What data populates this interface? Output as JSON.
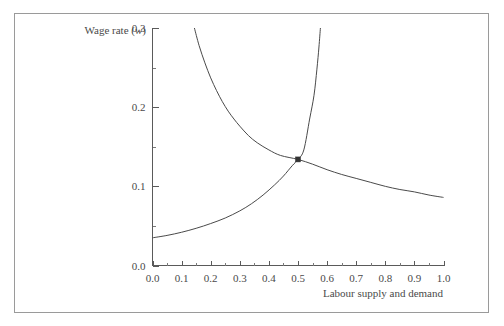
{
  "figure": {
    "border_color": "#9a9a9a",
    "background": "#ffffff"
  },
  "chart_data": {
    "type": "line",
    "title": "",
    "subtitle": "",
    "xlabel": "Labour supply and demand",
    "ylabel": "Wage rate (w)",
    "ylabel_plain": "Wage rate (",
    "ylabel_italic": "w",
    "ylabel_close": ")",
    "xlim": [
      0.0,
      1.0
    ],
    "ylim": [
      0.0,
      0.3
    ],
    "grid": false,
    "legend": "none",
    "x_ticks": [
      "0.0",
      "0.1",
      "0.2",
      "0.3",
      "0.4",
      "0.5",
      "0.6",
      "0.7",
      "0.8",
      "0.9",
      "1.0"
    ],
    "x_tick_values": [
      0.0,
      0.1,
      0.2,
      0.3,
      0.4,
      0.5,
      0.6,
      0.7,
      0.8,
      0.9,
      1.0
    ],
    "x_minor_values": [
      0.05,
      0.15,
      0.25,
      0.35,
      0.45,
      0.55,
      0.65,
      0.75,
      0.85,
      0.95
    ],
    "y_ticks": [
      "0.0",
      "0.1",
      "0.2",
      "0.3"
    ],
    "y_tick_values": [
      0.0,
      0.1,
      0.2,
      0.3
    ],
    "y_minor_values": [
      0.05,
      0.15,
      0.25
    ],
    "line_color": "#4a4a4a",
    "axis_color": "#5a5a5a",
    "marker_color": "#333333",
    "equilibrium": {
      "label": "",
      "x": 0.5,
      "y": 0.134
    },
    "series": [
      {
        "name": "Labour demand",
        "kind": "demand",
        "points": [
          [
            0.144,
            0.3
          ],
          [
            0.16,
            0.278
          ],
          [
            0.18,
            0.256
          ],
          [
            0.2,
            0.237
          ],
          [
            0.22,
            0.221
          ],
          [
            0.24,
            0.207
          ],
          [
            0.26,
            0.195
          ],
          [
            0.28,
            0.185
          ],
          [
            0.3,
            0.176
          ],
          [
            0.33,
            0.164
          ],
          [
            0.36,
            0.155
          ],
          [
            0.4,
            0.146
          ],
          [
            0.44,
            0.139
          ],
          [
            0.5,
            0.134
          ],
          [
            0.55,
            0.128
          ],
          [
            0.6,
            0.121
          ],
          [
            0.65,
            0.115
          ],
          [
            0.7,
            0.11
          ],
          [
            0.75,
            0.105
          ],
          [
            0.8,
            0.1
          ],
          [
            0.85,
            0.096
          ],
          [
            0.9,
            0.093
          ],
          [
            0.95,
            0.089
          ],
          [
            1.0,
            0.086
          ]
        ]
      },
      {
        "name": "Labour supply",
        "kind": "supply",
        "points": [
          [
            0.0,
            0.035
          ],
          [
            0.05,
            0.038
          ],
          [
            0.1,
            0.042
          ],
          [
            0.15,
            0.047
          ],
          [
            0.2,
            0.053
          ],
          [
            0.25,
            0.06
          ],
          [
            0.3,
            0.069
          ],
          [
            0.34,
            0.078
          ],
          [
            0.38,
            0.089
          ],
          [
            0.42,
            0.102
          ],
          [
            0.45,
            0.113
          ],
          [
            0.48,
            0.126
          ],
          [
            0.5,
            0.134
          ],
          [
            0.52,
            0.146
          ],
          [
            0.54,
            0.185
          ],
          [
            0.555,
            0.215
          ],
          [
            0.565,
            0.248
          ],
          [
            0.572,
            0.276
          ],
          [
            0.577,
            0.3
          ]
        ]
      }
    ]
  }
}
